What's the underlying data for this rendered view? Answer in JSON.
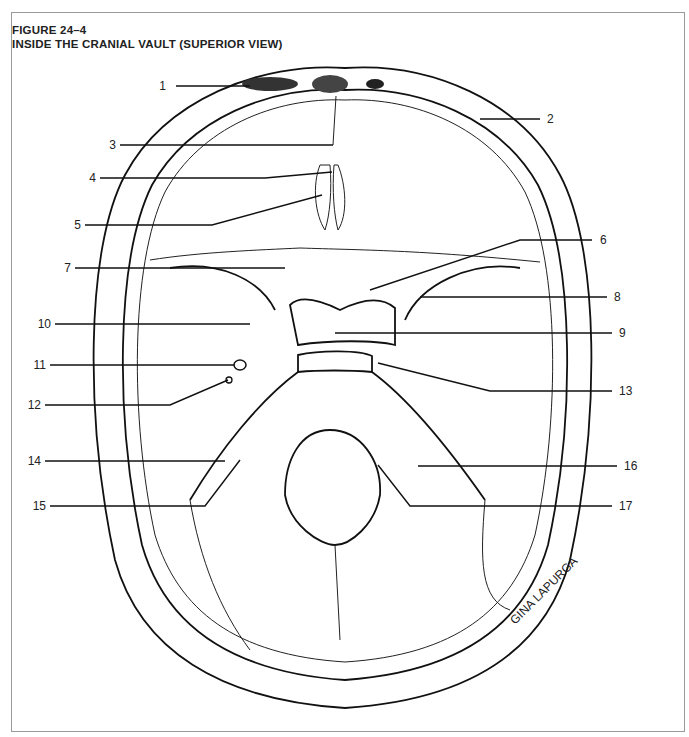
{
  "figure": {
    "number": "FIGURE 24–4",
    "title": "INSIDE THE CRANIAL VAULT (SUPERIOR VIEW)",
    "signature": "GINA LAPURGA"
  },
  "labels": [
    {
      "num": "1",
      "x": 166,
      "y": 89,
      "side": "left"
    },
    {
      "num": "2",
      "x": 547,
      "y": 122,
      "side": "right"
    },
    {
      "num": "3",
      "x": 110,
      "y": 148,
      "side": "left"
    },
    {
      "num": "4",
      "x": 90,
      "y": 181,
      "side": "left"
    },
    {
      "num": "5",
      "x": 75,
      "y": 228,
      "side": "left"
    },
    {
      "num": "6",
      "x": 600,
      "y": 243,
      "side": "right"
    },
    {
      "num": "7",
      "x": 65,
      "y": 271,
      "side": "left"
    },
    {
      "num": "8",
      "x": 614,
      "y": 300,
      "side": "right"
    },
    {
      "num": "9",
      "x": 619,
      "y": 336,
      "side": "right"
    },
    {
      "num": "10",
      "x": 38,
      "y": 327,
      "side": "left"
    },
    {
      "num": "11",
      "x": 33,
      "y": 368,
      "side": "left"
    },
    {
      "num": "12",
      "x": 28,
      "y": 408,
      "side": "left"
    },
    {
      "num": "13",
      "x": 619,
      "y": 394,
      "side": "right"
    },
    {
      "num": "14",
      "x": 28,
      "y": 464,
      "side": "left"
    },
    {
      "num": "15",
      "x": 33,
      "y": 509,
      "side": "left"
    },
    {
      "num": "16",
      "x": 624,
      "y": 469,
      "side": "right"
    },
    {
      "num": "17",
      "x": 619,
      "y": 509,
      "side": "right"
    }
  ]
}
